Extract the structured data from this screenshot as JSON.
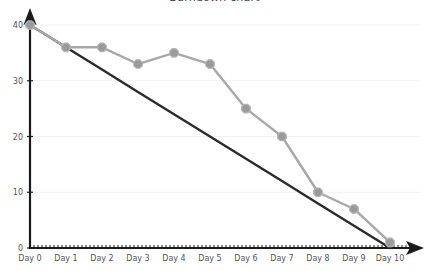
{
  "chart": {
    "title": "Burndown chart"
  },
  "chart_data": {
    "type": "line",
    "title": "Burndown chart",
    "xlabel": "",
    "ylabel": "",
    "categories": [
      "Day 0",
      "Day 1",
      "Day 2",
      "Day 3",
      "Day 4",
      "Day 5",
      "Day 6",
      "Day 7",
      "Day 8",
      "Day 9",
      "Day 10"
    ],
    "x": [
      0,
      1,
      2,
      3,
      4,
      5,
      6,
      7,
      8,
      9,
      10
    ],
    "xlim": [
      0,
      10
    ],
    "ylim": [
      0,
      40
    ],
    "yticks": [
      0,
      10,
      20,
      30,
      40
    ],
    "ytick_labels": [
      "0",
      "10",
      "20",
      "30",
      "40"
    ],
    "grid": true,
    "legend": "none",
    "series": [
      {
        "name": "Ideal",
        "color": "#2b2b2b",
        "style": "straight-line",
        "markers": false,
        "values": [
          40,
          36,
          32,
          28,
          24,
          20,
          16,
          12,
          8,
          4,
          0
        ]
      },
      {
        "name": "Actual",
        "color": "#a8a8a8",
        "style": "line-with-markers",
        "markers": true,
        "values": [
          40,
          36,
          36,
          33,
          35,
          33,
          25,
          20,
          10,
          7,
          1
        ]
      }
    ]
  },
  "axes": {
    "y_labels": [
      "40",
      "30",
      "20",
      "10",
      "0"
    ],
    "x_labels": [
      "Day 0",
      "Day 1",
      "Day 2",
      "Day 3",
      "Day 4",
      "Day 5",
      "Day 6",
      "Day 7",
      "Day 8",
      "Day 9",
      "Day 10"
    ]
  }
}
